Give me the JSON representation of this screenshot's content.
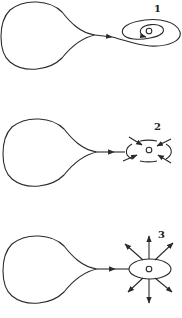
{
  "diagram": {
    "panels": [
      {
        "label": "1",
        "state": "closed orbits spiraling inward around point"
      },
      {
        "label": "2",
        "state": "arrows pointing inward toward point"
      },
      {
        "label": "3",
        "state": "arrows pointing outward from point"
      }
    ]
  },
  "colors": {
    "stroke": "#2a2a2a",
    "background": "#ffffff"
  }
}
